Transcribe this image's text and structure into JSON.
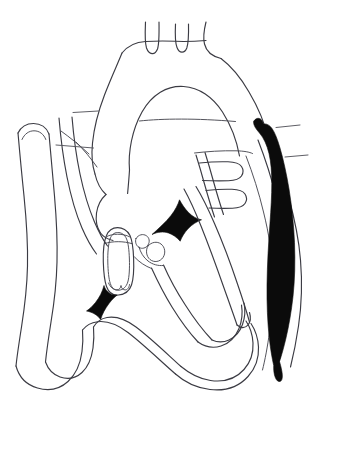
{
  "figure": {
    "title": "Cardiac anatomy line diagram",
    "style": "line-art",
    "background_color": "#ffffff",
    "stroke_color": "#3b3b43",
    "fill_color": "#0b0b0b",
    "canvas": {
      "width": 340,
      "height": 468
    }
  },
  "structures": [
    {
      "id": "aortic-arch",
      "name": "aortic arch",
      "rendering": "outline"
    },
    {
      "id": "brachiocephalic-trunk",
      "name": "brachiocephalic trunk branch",
      "rendering": "outline"
    },
    {
      "id": "left-common-carotid-artery",
      "name": "left common carotid artery branch",
      "rendering": "outline"
    },
    {
      "id": "left-subclavian-artery",
      "name": "left subclavian artery branch",
      "rendering": "outline"
    },
    {
      "id": "ascending-aorta",
      "name": "ascending aorta",
      "rendering": "outline"
    },
    {
      "id": "descending-aorta",
      "name": "descending aorta",
      "rendering": "outline"
    },
    {
      "id": "superior-vena-cava",
      "name": "superior vena cava",
      "rendering": "outline"
    },
    {
      "id": "left-great-vein",
      "name": "left hooked great vein",
      "rendering": "outline"
    },
    {
      "id": "pulmonary-veins",
      "name": "pulmonary vein openings",
      "rendering": "outline"
    },
    {
      "id": "aortic-valve",
      "name": "aortic valve cusps",
      "rendering": "outline"
    },
    {
      "id": "mitral-valve-leaflet",
      "name": "central valve leaflet",
      "rendering": "solid-black"
    },
    {
      "id": "lower-valve-leaflet",
      "name": "lower left valve leaflet",
      "rendering": "solid-black"
    },
    {
      "id": "shaded-vessel",
      "name": "solid black elongated vessel",
      "rendering": "solid-black"
    },
    {
      "id": "left-ventricle",
      "name": "left ventricle chamber",
      "rendering": "outline"
    },
    {
      "id": "right-ventricle",
      "name": "right ventricle chamber",
      "rendering": "outline"
    },
    {
      "id": "left-atrium",
      "name": "left atrium chamber",
      "rendering": "outline"
    },
    {
      "id": "cardiac-apex",
      "name": "cardiac apex",
      "rendering": "outline"
    }
  ],
  "leader_lines": [
    {
      "id": "leader-left-upper",
      "side": "left",
      "label": ""
    },
    {
      "id": "leader-left-mid",
      "side": "left",
      "label": ""
    },
    {
      "id": "leader-right-upper",
      "side": "right",
      "label": ""
    },
    {
      "id": "leader-right-lower",
      "side": "right",
      "label": ""
    }
  ],
  "labels": []
}
